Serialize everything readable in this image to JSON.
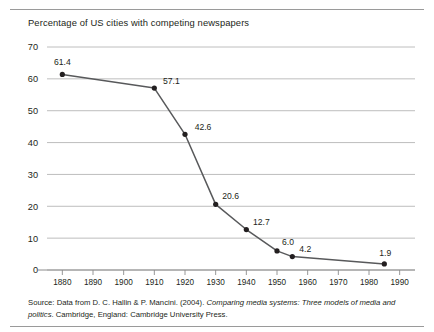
{
  "figure": {
    "title": "Percentage of US cities with competing newspapers",
    "source_prefix": "Source: Data from D. C. Hallin & P. Mancini. (2004). ",
    "source_italic": "Comparing media systems: Three models of media and politics",
    "source_suffix": ". Cambridge, England: Cambridge University Press."
  },
  "colors": {
    "line": "#58595b",
    "marker": "#231f20",
    "grid": "#b7b7b7",
    "axis": "#8c8c8c",
    "text": "#231f20",
    "rule": "#9a9a9a",
    "background": "#ffffff"
  },
  "chart_data": {
    "type": "line",
    "title": "Percentage of US cities with competing newspapers",
    "xlabel": "",
    "ylabel": "",
    "xlim": [
      1875,
      1995
    ],
    "ylim": [
      0,
      70
    ],
    "grid": true,
    "legend_position": "none",
    "x_ticks": [
      1880,
      1890,
      1900,
      1910,
      1920,
      1930,
      1940,
      1950,
      1960,
      1970,
      1980,
      1990
    ],
    "y_ticks": [
      0,
      10,
      20,
      30,
      40,
      50,
      60,
      70
    ],
    "x": [
      1880,
      1910,
      1920,
      1930,
      1940,
      1950,
      1955,
      1985
    ],
    "values": [
      61.4,
      57.1,
      42.6,
      20.6,
      12.7,
      6.0,
      4.2,
      1.9
    ],
    "point_labels": [
      "61.4",
      "57.1",
      "42.6",
      "20.6",
      "12.7",
      "6.0",
      "4.2",
      "1.9"
    ],
    "series": [
      {
        "name": "Percentage of US cities with competing newspapers",
        "values": [
          61.4,
          57.1,
          42.6,
          20.6,
          12.7,
          6.0,
          4.2,
          1.9
        ]
      }
    ]
  }
}
